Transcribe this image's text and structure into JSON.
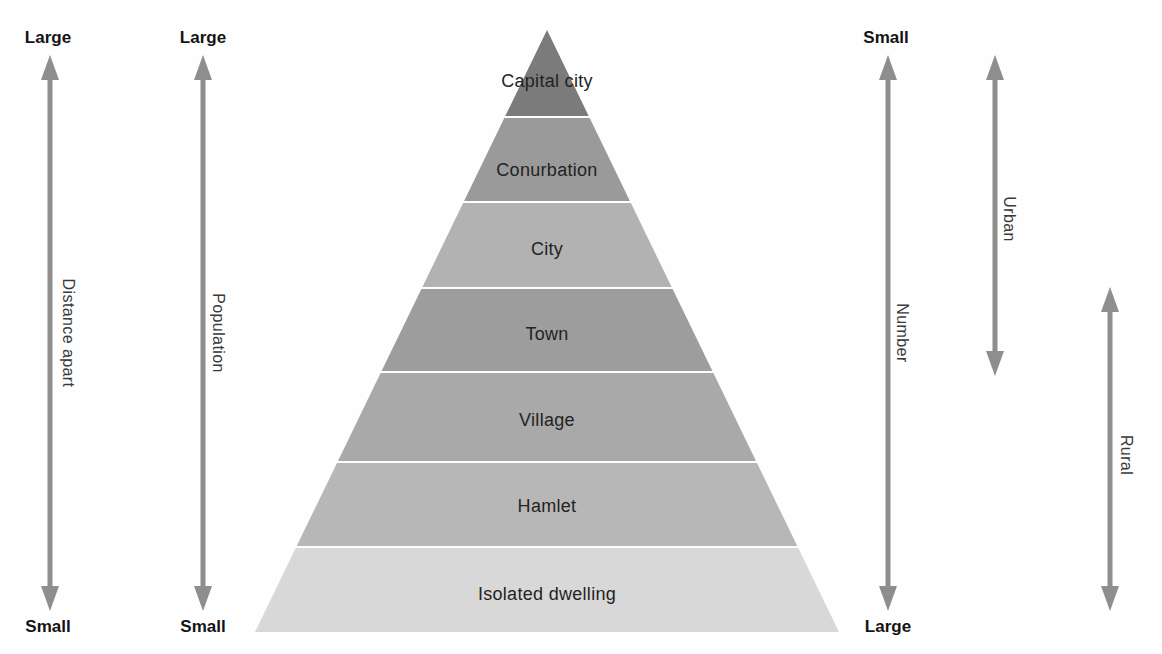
{
  "pyramid": {
    "levels": [
      {
        "label": "Capital city",
        "color": "#7b7b7b"
      },
      {
        "label": "Conurbation",
        "color": "#9a9a9a"
      },
      {
        "label": "City",
        "color": "#b2b2b2"
      },
      {
        "label": "Town",
        "color": "#9d9d9d"
      },
      {
        "label": "Village",
        "color": "#a9a9a9"
      },
      {
        "label": "Hamlet",
        "color": "#b7b7b7"
      },
      {
        "label": "Isolated dwelling",
        "color": "#d8d8d8"
      }
    ]
  },
  "scales": {
    "distance": {
      "label": "Distance apart",
      "top": "Large",
      "bottom": "Small"
    },
    "population": {
      "label": "Population",
      "top": "Large",
      "bottom": "Small"
    },
    "number": {
      "label": "Number",
      "top": "Small",
      "bottom": "Large"
    },
    "urban": {
      "label": "Urban"
    },
    "rural": {
      "label": "Rural"
    }
  },
  "colors": {
    "arrow": "#8e8e8e",
    "background": "#fefefe"
  }
}
